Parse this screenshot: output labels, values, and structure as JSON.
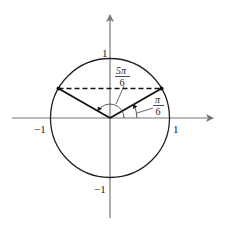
{
  "diagram": {
    "title": "",
    "colors": {
      "axis": "#777777",
      "circle": "#222222",
      "radius": "#111111",
      "chord": "#111111",
      "text": "#222222"
    },
    "axis_labels": {
      "y_top": "1",
      "y_bottom": "−1",
      "x_left": "−1",
      "x_right": "1"
    },
    "angles": [
      {
        "name": "pi-over-6",
        "numerator": "π",
        "denominator": "6",
        "degrees": 30
      },
      {
        "name": "five-pi-over-6",
        "numerator": "5π",
        "denominator": "6",
        "degrees": 150
      }
    ],
    "points": [
      {
        "name": "point-pi-over-6",
        "x": 0.866,
        "y": 0.5
      },
      {
        "name": "point-5pi-over-6",
        "x": -0.866,
        "y": 0.5
      }
    ],
    "chord": {
      "style": "dashed",
      "y": 0.5
    }
  }
}
